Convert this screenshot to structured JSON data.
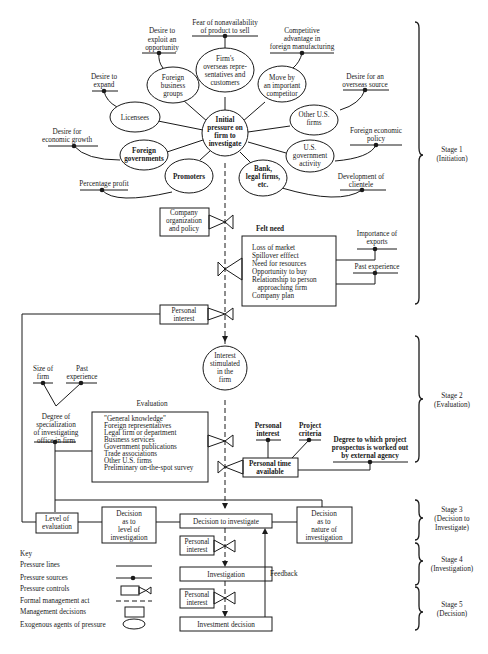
{
  "diagram": {
    "type": "flow-process",
    "center_node": {
      "lines": [
        "Initial",
        "pressure on",
        "firm to",
        "investigate"
      ]
    },
    "pressure_agents": [
      {
        "id": "licensees",
        "lines": [
          "Licensees"
        ]
      },
      {
        "id": "foreign_business_groups",
        "lines": [
          "Foreign",
          "business",
          "groups"
        ]
      },
      {
        "id": "overseas_reps",
        "lines": [
          "Firm's",
          "overseas repre-",
          "sentatives and",
          "customers"
        ]
      },
      {
        "id": "important_competitor",
        "lines": [
          "Move by",
          "an important",
          "competitor"
        ]
      },
      {
        "id": "other_us_firms",
        "lines": [
          "Other U.S.",
          "firms"
        ]
      },
      {
        "id": "us_government",
        "lines": [
          "U.S.",
          "government",
          "activity"
        ]
      },
      {
        "id": "bank_legal",
        "lines": [
          "Bank,",
          "legal firms,",
          "etc."
        ]
      },
      {
        "id": "promoters",
        "lines": [
          "Promoters"
        ]
      },
      {
        "id": "foreign_governments",
        "lines": [
          "Foreign",
          "governments"
        ]
      }
    ],
    "pressure_sources": [
      {
        "id": "exploit_opportunity",
        "lines": [
          "Desire to",
          "exploit an",
          "opportunity"
        ]
      },
      {
        "id": "fear_nonavailability",
        "lines": [
          "Fear of nonavailability",
          "of product to sell"
        ]
      },
      {
        "id": "competitive_advantage",
        "lines": [
          "Competitive",
          "advantage in",
          "foreign manufacturing"
        ]
      },
      {
        "id": "desire_expand",
        "lines": [
          "Desire to",
          "expand"
        ]
      },
      {
        "id": "overseas_source",
        "lines": [
          "Desire for an",
          "overseas source"
        ]
      },
      {
        "id": "economic_growth",
        "lines": [
          "Desire for",
          "economic growth"
        ]
      },
      {
        "id": "foreign_economic_policy",
        "lines": [
          "Foreign economic",
          "policy"
        ]
      },
      {
        "id": "percentage_profit",
        "lines": [
          "Percentage profit"
        ]
      },
      {
        "id": "development_clientele",
        "lines": [
          "Development of",
          "clientele"
        ]
      },
      {
        "id": "importance_exports",
        "lines": [
          "Importance of",
          "exports"
        ]
      },
      {
        "id": "past_experience_1",
        "lines": [
          "Past experience"
        ]
      },
      {
        "id": "size_of_firm",
        "lines": [
          "Size of",
          "firm"
        ]
      },
      {
        "id": "past_experience_2",
        "lines": [
          "Past",
          "experience"
        ]
      },
      {
        "id": "degree_specialization",
        "lines": [
          "Degree of",
          "specialization",
          "of investigating",
          "office in firm"
        ]
      },
      {
        "id": "personal_interest_src",
        "lines": [
          "Personal",
          "interest"
        ]
      },
      {
        "id": "project_criteria",
        "lines": [
          "Project",
          "criteria"
        ]
      },
      {
        "id": "external_agency",
        "lines": [
          "Degree to which project",
          "prospectus is worked out",
          "by external agency"
        ]
      }
    ],
    "controls": [
      {
        "id": "company_org",
        "lines": [
          "Company",
          "organization",
          "and policy"
        ]
      },
      {
        "id": "personal_interest_1",
        "lines": [
          "Personal",
          "interest"
        ]
      },
      {
        "id": "personal_time",
        "lines": [
          "Personal time",
          "available"
        ]
      },
      {
        "id": "personal_interest_2",
        "lines": [
          "Personal",
          "interest"
        ]
      },
      {
        "id": "personal_interest_3",
        "lines": [
          "Personal",
          "interest"
        ]
      }
    ],
    "felt_need": {
      "title": "Felt need",
      "items": [
        "Loss of market",
        "Spillover efffect",
        "Need for resources",
        "Opportunity to buy",
        "Relationship to person",
        "   approaching firm",
        "Company plan"
      ]
    },
    "interest_node": {
      "lines": [
        "Interest",
        "stimulated",
        "in the",
        "firm"
      ]
    },
    "evaluation": {
      "title": "Evaluation",
      "items": [
        "\"General knowledge\"",
        "Foreign representatives",
        "Legal firm or department",
        "Business services",
        "Government publications",
        "Trade associations",
        "Other U.S. firms",
        "Preliminary on-the-spot survey"
      ]
    },
    "decisions": {
      "level_of_evaluation": {
        "lines": [
          "Level of",
          "evaluation"
        ]
      },
      "level_of_investigation": {
        "lines": [
          "Decision",
          "as to",
          "level of",
          "investigation"
        ]
      },
      "decision_to_investigate": {
        "lines": [
          "Decision to investigate"
        ]
      },
      "nature_of_investigation": {
        "lines": [
          "Decision",
          "as to",
          "nature of",
          "investigation"
        ]
      },
      "investigation": {
        "lines": [
          "Investigation"
        ]
      },
      "investment_decision": {
        "lines": [
          "Investment decision"
        ]
      }
    },
    "feedback_label": "Feedback",
    "stages": [
      {
        "lines": [
          "Stage 1",
          "(Initiation)"
        ]
      },
      {
        "lines": [
          "Stage 2",
          "(Evaluation)"
        ]
      },
      {
        "lines": [
          "Stage 3",
          "(Decision to",
          "Investigate)"
        ]
      },
      {
        "lines": [
          "Stage 4",
          "(Investigation)"
        ]
      },
      {
        "lines": [
          "Stage 5",
          "(Decision)"
        ]
      }
    ],
    "key": {
      "title": "Key",
      "items": [
        "Pressure lines",
        "Pressure sources",
        "Pressure controls",
        "Formal management act",
        "Management decisions",
        "Exogenous agents of pressure"
      ]
    }
  }
}
